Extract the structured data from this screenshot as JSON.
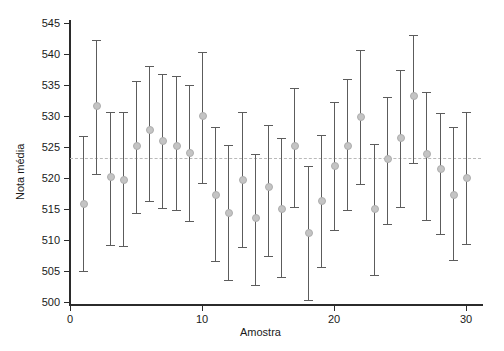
{
  "chart_data": {
    "type": "scatter",
    "title": "",
    "xlabel": "Amostra",
    "ylabel": "Nota média",
    "xlim": [
      0,
      31
    ],
    "ylim": [
      499,
      547
    ],
    "grid": false,
    "legend": null,
    "x_ticks": [
      0,
      10,
      20,
      30
    ],
    "x_tick_labels": [
      "0",
      "10",
      "20",
      "30"
    ],
    "y_ticks": [
      500,
      505,
      510,
      515,
      520,
      525,
      530,
      535,
      540,
      545
    ],
    "y_tick_labels": [
      "500",
      "505",
      "510",
      "515",
      "520",
      "525",
      "530",
      "535",
      "540",
      "545"
    ],
    "center_line": {
      "value": 523.2,
      "style": "dashed",
      "color": "#b9b9b9",
      "label": ""
    },
    "marker_color": "#c4c4c4",
    "errorbar_color": "#5c5c5c",
    "series_name": "Nota média com intervalo de confiança",
    "x": [
      1,
      2,
      3,
      4,
      5,
      6,
      7,
      8,
      9,
      10,
      11,
      12,
      13,
      14,
      15,
      16,
      17,
      18,
      19,
      20,
      21,
      22,
      23,
      24,
      25,
      26,
      27,
      28,
      29,
      30
    ],
    "values": [
      515.8,
      531.6,
      520.1,
      519.7,
      525.1,
      527.8,
      526.0,
      525.2,
      524.1,
      530.0,
      517.3,
      514.3,
      519.6,
      513.5,
      518.5,
      515.0,
      525.1,
      511.1,
      516.3,
      522.0,
      525.1,
      529.8,
      515.0,
      523.0,
      526.5,
      533.2,
      523.9,
      521.5,
      517.3,
      520.0
    ],
    "upper": [
      526.7,
      542.2,
      530.7,
      530.6,
      535.6,
      538.0,
      536.8,
      536.4,
      535.0,
      540.3,
      528.3,
      525.3,
      530.7,
      523.9,
      528.6,
      526.5,
      534.5,
      522.0,
      527.0,
      532.2,
      536.0,
      540.6,
      525.5,
      533.1,
      537.5,
      543.0,
      533.8,
      530.5,
      528.2,
      530.7
    ],
    "lower": [
      505.0,
      520.6,
      509.2,
      509.0,
      514.3,
      516.3,
      515.1,
      514.9,
      513.1,
      519.2,
      506.6,
      503.5,
      508.9,
      502.7,
      507.4,
      504.0,
      515.3,
      500.3,
      505.6,
      511.6,
      514.8,
      519.1,
      504.4,
      512.5,
      515.3,
      522.4,
      513.2,
      511.0,
      506.7,
      509.3
    ],
    "n_samples": 30
  },
  "axes": {
    "y_title": "Nota média",
    "x_title": "Amostra"
  }
}
